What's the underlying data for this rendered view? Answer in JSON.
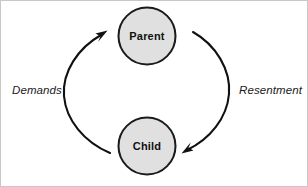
{
  "diagram": {
    "background_color": "#ffffff",
    "nodes": [
      {
        "id": "parent",
        "label": "Parent",
        "cx": 147,
        "cy": 36,
        "r": 28.5,
        "fill": "#e0e0e0",
        "stroke": "#1a1a1a"
      },
      {
        "id": "child",
        "label": "Child",
        "cx": 147,
        "cy": 146,
        "r": 28.5,
        "fill": "#e0e0e0",
        "stroke": "#1a1a1a"
      }
    ],
    "edges": [
      {
        "id": "demands",
        "label": "Demands",
        "from": "child",
        "to": "parent",
        "side": "left",
        "label_x": 12,
        "label_y": 94,
        "color": "#111111"
      },
      {
        "id": "resentment",
        "label": "Resentment",
        "from": "parent",
        "to": "child",
        "side": "right",
        "label_x": 239,
        "label_y": 94,
        "color": "#111111"
      }
    ]
  }
}
